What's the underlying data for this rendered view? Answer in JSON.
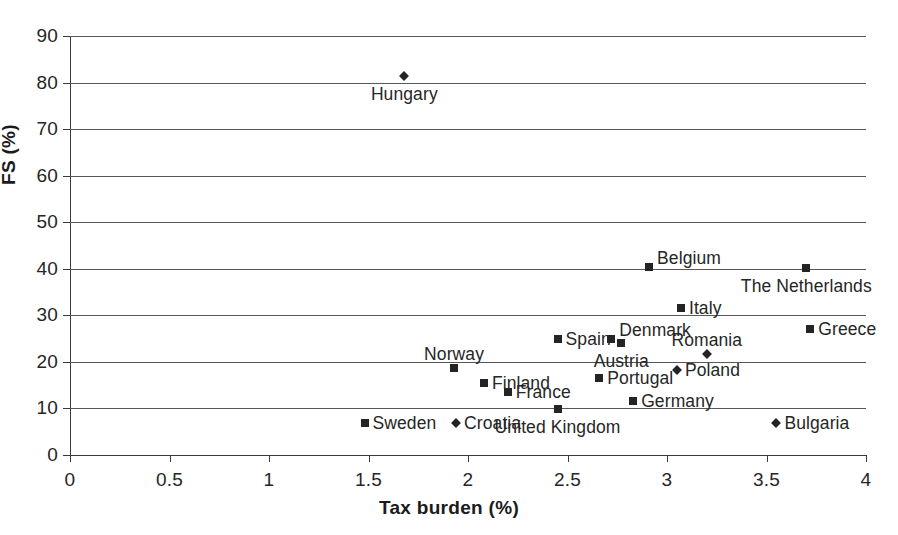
{
  "chart_data": {
    "type": "scatter",
    "title": "",
    "xlabel": "Tax burden (%)",
    "ylabel": "FS (%)",
    "xlim": [
      0,
      4
    ],
    "ylim": [
      0,
      90
    ],
    "xticks": [
      "0",
      "0.5",
      "1",
      "1.5",
      "2",
      "2.5",
      "3",
      "3.5",
      "4"
    ],
    "xtick_values": [
      0,
      0.5,
      1,
      1.5,
      2,
      2.5,
      3,
      3.5,
      4
    ],
    "yticks": [
      "0",
      "10",
      "20",
      "30",
      "40",
      "50",
      "60",
      "70",
      "80",
      "90"
    ],
    "ytick_values": [
      0,
      10,
      20,
      30,
      40,
      50,
      60,
      70,
      80,
      90
    ],
    "grid": "horizontal",
    "legend": "none",
    "points": [
      {
        "label": "Hungary",
        "x": 1.68,
        "y": 81.5,
        "marker": "diamond",
        "label_pos": "below"
      },
      {
        "label": "Belgium",
        "x": 2.91,
        "y": 40.3,
        "marker": "square",
        "label_pos": "right-up"
      },
      {
        "label": "The Netherlands",
        "x": 3.7,
        "y": 40.2,
        "marker": "square",
        "label_pos": "below"
      },
      {
        "label": "Italy",
        "x": 3.07,
        "y": 31.6,
        "marker": "square",
        "label_pos": "right"
      },
      {
        "label": "Greece",
        "x": 3.72,
        "y": 27.0,
        "marker": "square",
        "label_pos": "right"
      },
      {
        "label": "Spain",
        "x": 2.45,
        "y": 25.0,
        "marker": "square",
        "label_pos": "right"
      },
      {
        "label": "Denmark",
        "x": 2.72,
        "y": 25.0,
        "marker": "square",
        "label_pos": "right-up"
      },
      {
        "label": "Austria",
        "x": 2.77,
        "y": 24.0,
        "marker": "square",
        "label_pos": "below"
      },
      {
        "label": "Romania",
        "x": 3.2,
        "y": 21.8,
        "marker": "diamond",
        "label_pos": "above"
      },
      {
        "label": "Norway",
        "x": 1.93,
        "y": 18.6,
        "marker": "square",
        "label_pos": "above"
      },
      {
        "label": "Poland",
        "x": 3.05,
        "y": 18.2,
        "marker": "diamond",
        "label_pos": "right"
      },
      {
        "label": "Portugal",
        "x": 2.66,
        "y": 16.5,
        "marker": "square",
        "label_pos": "right"
      },
      {
        "label": "Finland",
        "x": 2.08,
        "y": 15.4,
        "marker": "square",
        "label_pos": "right"
      },
      {
        "label": "France",
        "x": 2.2,
        "y": 13.6,
        "marker": "square",
        "label_pos": "right"
      },
      {
        "label": "Germany",
        "x": 2.83,
        "y": 11.5,
        "marker": "square",
        "label_pos": "right"
      },
      {
        "label": "United Kingdom",
        "x": 2.45,
        "y": 9.8,
        "marker": "square",
        "label_pos": "below"
      },
      {
        "label": "Sweden",
        "x": 1.48,
        "y": 6.8,
        "marker": "square",
        "label_pos": "right"
      },
      {
        "label": "Croatia",
        "x": 1.94,
        "y": 6.8,
        "marker": "diamond",
        "label_pos": "right"
      },
      {
        "label": "Bulgaria",
        "x": 3.55,
        "y": 6.8,
        "marker": "diamond",
        "label_pos": "right"
      }
    ]
  },
  "colors": {
    "marker": "#242424",
    "gridline": "#58585a",
    "axis": "#3a3a3a",
    "text": "#262626",
    "background": "#ffffff"
  }
}
